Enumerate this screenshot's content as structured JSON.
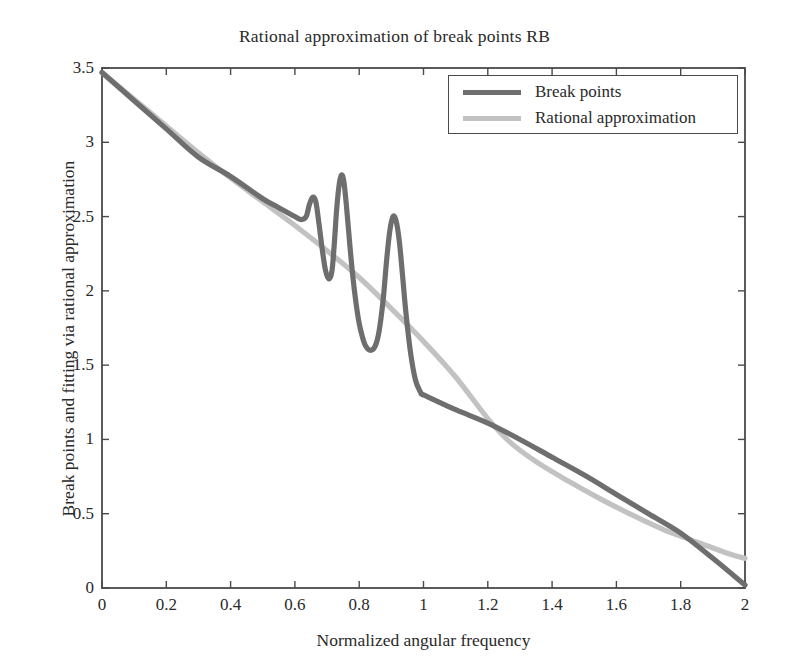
{
  "chart_data": {
    "type": "line",
    "title": "Rational approximation of break points RB",
    "xlabel": "Normalized angular frequency",
    "ylabel": "Break points and fitting via rational approximation",
    "xlim": [
      0,
      2
    ],
    "ylim": [
      0,
      3.5
    ],
    "grid": false,
    "legend_position": "top-right",
    "xticks": [
      "0",
      "0.2",
      "0.4",
      "0.6",
      "0.8",
      "1",
      "1.2",
      "1.4",
      "1.6",
      "1.8",
      "2"
    ],
    "xtick_values": [
      0,
      0.2,
      0.4,
      0.6,
      0.8,
      1,
      1.2,
      1.4,
      1.6,
      1.8,
      2
    ],
    "yticks": [
      "0",
      "0.5",
      "1",
      "1.5",
      "2",
      "2.5",
      "3",
      "3.5"
    ],
    "ytick_values": [
      0,
      0.5,
      1,
      1.5,
      2,
      2.5,
      3,
      3.5
    ],
    "series": [
      {
        "name": "Break points",
        "color": "#6e6e6e",
        "x": [
          0,
          0.1,
          0.2,
          0.3,
          0.4,
          0.5,
          0.55,
          0.6,
          0.62,
          0.635,
          0.645,
          0.655,
          0.665,
          0.675,
          0.685,
          0.695,
          0.705,
          0.715,
          0.722,
          0.73,
          0.738,
          0.745,
          0.752,
          0.76,
          0.77,
          0.78,
          0.79,
          0.8,
          0.81,
          0.82,
          0.835,
          0.85,
          0.862,
          0.875,
          0.885,
          0.895,
          0.905,
          0.915,
          0.925,
          0.935,
          0.945,
          0.96,
          0.975,
          0.99,
          0.998,
          1.0,
          1.1,
          1.2,
          1.3,
          1.4,
          1.5,
          1.6,
          1.7,
          1.8,
          1.9,
          2.0
        ],
        "y": [
          3.47,
          3.28,
          3.09,
          2.9,
          2.77,
          2.62,
          2.56,
          2.5,
          2.48,
          2.5,
          2.58,
          2.63,
          2.6,
          2.45,
          2.28,
          2.14,
          2.08,
          2.13,
          2.3,
          2.55,
          2.72,
          2.78,
          2.74,
          2.58,
          2.33,
          2.1,
          1.92,
          1.78,
          1.69,
          1.63,
          1.6,
          1.63,
          1.73,
          1.95,
          2.2,
          2.4,
          2.5,
          2.47,
          2.33,
          2.1,
          1.86,
          1.58,
          1.4,
          1.32,
          1.3,
          1.3,
          1.2,
          1.11,
          1.0,
          0.88,
          0.76,
          0.63,
          0.5,
          0.37,
          0.2,
          0.02
        ]
      },
      {
        "name": "Rational approximation",
        "color": "#c2c2c2",
        "x": [
          0,
          0.1,
          0.2,
          0.3,
          0.4,
          0.5,
          0.6,
          0.7,
          0.8,
          0.9,
          1.0,
          1.1,
          1.2,
          1.27,
          1.35,
          1.45,
          1.55,
          1.65,
          1.75,
          1.85,
          1.95,
          2.0
        ],
        "y": [
          3.47,
          3.29,
          3.11,
          2.93,
          2.76,
          2.6,
          2.44,
          2.27,
          2.09,
          1.88,
          1.66,
          1.42,
          1.14,
          0.98,
          0.85,
          0.72,
          0.6,
          0.49,
          0.39,
          0.31,
          0.23,
          0.2
        ]
      }
    ]
  },
  "legend": {
    "items": [
      {
        "label": "Break points",
        "color": "#6e6e6e"
      },
      {
        "label": "Rational approximation",
        "color": "#c2c2c2"
      }
    ]
  },
  "axes": {
    "frame_color": "#4a4a4a"
  }
}
